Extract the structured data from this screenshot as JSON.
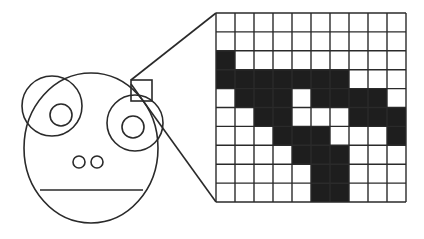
{
  "diagram": {
    "title": "",
    "colors": {
      "ink": "#2a2a2a",
      "filled_cell": "#1e1e1e",
      "background": "#ffffff"
    },
    "face": {
      "parts": [
        "head",
        "left-eye",
        "left-pupil",
        "right-eye",
        "right-pupil",
        "left-nostril",
        "right-nostril",
        "mouth-line"
      ],
      "magnified_region": "upper edge of right eye"
    },
    "pixel_grid": {
      "rows": 10,
      "cols": 10,
      "cells": [
        [
          0,
          0,
          0,
          0,
          0,
          0,
          0,
          0,
          0,
          0
        ],
        [
          0,
          0,
          0,
          0,
          0,
          0,
          0,
          0,
          0,
          0
        ],
        [
          1,
          0,
          0,
          0,
          0,
          0,
          0,
          0,
          0,
          0
        ],
        [
          1,
          1,
          1,
          1,
          1,
          1,
          1,
          0,
          0,
          0
        ],
        [
          0,
          1,
          1,
          1,
          0,
          1,
          1,
          1,
          1,
          0
        ],
        [
          0,
          0,
          1,
          1,
          0,
          0,
          0,
          1,
          1,
          1
        ],
        [
          0,
          0,
          0,
          1,
          1,
          1,
          0,
          0,
          0,
          1
        ],
        [
          0,
          0,
          0,
          0,
          1,
          1,
          1,
          0,
          0,
          0
        ],
        [
          0,
          0,
          0,
          0,
          0,
          1,
          1,
          0,
          0,
          0
        ],
        [
          0,
          0,
          0,
          0,
          0,
          1,
          1,
          0,
          0,
          0
        ]
      ]
    }
  }
}
